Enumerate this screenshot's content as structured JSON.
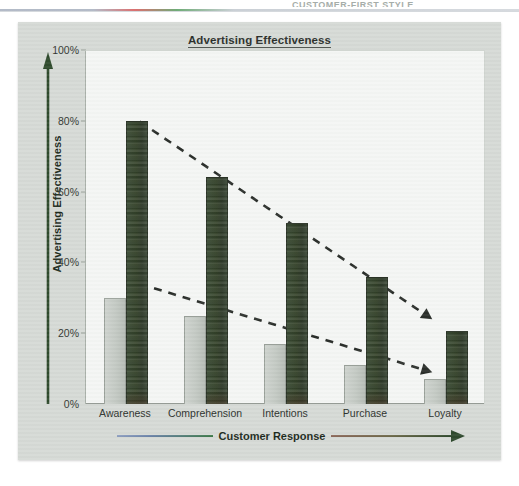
{
  "page": {
    "bleed_header": "CUSTOMER-FIRST STYLE",
    "bleed_watermark": "Nielsen Marketing and Customer"
  },
  "figure": {
    "title": "Advertising Effectiveness",
    "y_axis_title": "Advertising Effectiveness",
    "x_axis_title": "Customer Response",
    "y_arrow_color": "#2e4a2c",
    "x_arrow_color": "#2f4a2e"
  },
  "colors": {
    "panel_bg": "#d6dad6",
    "plot_bg": "#f4f6f4",
    "series_gray": "#c6ccc6",
    "series_green": "#34422C",
    "trend_line": "#2b2f2b",
    "axis": "#8f968f"
  },
  "chart_data": {
    "type": "bar",
    "title": "Advertising Effectiveness",
    "xlabel": "Customer Response",
    "ylabel": "Advertising Effectiveness",
    "ylim": [
      0,
      100
    ],
    "yticks": [
      "0%",
      "20%",
      "40%",
      "60%",
      "80%",
      "100%"
    ],
    "ytick_values": [
      0,
      20,
      40,
      60,
      80,
      100
    ],
    "grid": false,
    "legend_position": "none",
    "categories": [
      "Awareness",
      "Comprehension",
      "Intentions",
      "Purchase",
      "Loyalty"
    ],
    "series": [
      {
        "name": "Lower response",
        "color": "#c6ccc6",
        "values": [
          30,
          25,
          17,
          11,
          7
        ]
      },
      {
        "name": "Higher response",
        "color": "#34422C",
        "values": [
          80,
          64,
          51,
          36,
          20.5
        ]
      }
    ],
    "annotations": [
      {
        "name": "upper-trend-arrow",
        "type": "dashed-arrow",
        "from": {
          "category": "Awareness",
          "value": 80
        },
        "to": {
          "category": "Loyalty",
          "value": 24
        }
      },
      {
        "name": "lower-trend-arrow",
        "type": "dashed-arrow",
        "from": {
          "category": "Awareness",
          "value": 34
        },
        "to": {
          "category": "Loyalty",
          "value": 9
        }
      }
    ]
  }
}
